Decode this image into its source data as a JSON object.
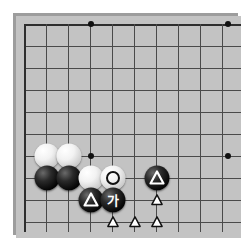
{
  "diagram": {
    "type": "go-board-diagram",
    "game": "Go (Baduk)",
    "board_region": "bottom-left corner, partial board",
    "grid": {
      "columns": 10,
      "rows": 10,
      "spacing_px": 22,
      "origin_x": 24,
      "origin_y": 24,
      "line_color": "#4a4a4a",
      "edge_color": "#2e2e2e",
      "board_color": "#c3c3c3",
      "shadow_color": "#9d9d9d"
    },
    "star_points": [
      {
        "name": "hoshi-upper-left",
        "x": 91,
        "y": 24
      },
      {
        "name": "hoshi-upper-right",
        "x": 228,
        "y": 24
      },
      {
        "name": "hoshi-lower-left",
        "x": 91,
        "y": 156
      },
      {
        "name": "hoshi-lower-right",
        "x": 228,
        "y": 156
      }
    ],
    "stones": [
      {
        "id": "w1",
        "color": "white",
        "x": 47,
        "y": 156,
        "mark": "none",
        "label": ""
      },
      {
        "id": "w2",
        "color": "white",
        "x": 69,
        "y": 156,
        "mark": "none",
        "label": ""
      },
      {
        "id": "b1",
        "color": "black",
        "x": 47,
        "y": 178,
        "mark": "none",
        "label": ""
      },
      {
        "id": "b2",
        "color": "black",
        "x": 69,
        "y": 178,
        "mark": "none",
        "label": ""
      },
      {
        "id": "w3",
        "color": "white",
        "x": 91,
        "y": 178,
        "mark": "none",
        "label": ""
      },
      {
        "id": "w4",
        "color": "white",
        "x": 113,
        "y": 178,
        "mark": "circle",
        "label": ""
      },
      {
        "id": "b3",
        "color": "black",
        "x": 157,
        "y": 178,
        "mark": "triangle",
        "label": ""
      },
      {
        "id": "b4",
        "color": "black",
        "x": 91,
        "y": 200,
        "mark": "triangle",
        "label": ""
      },
      {
        "id": "b5",
        "color": "black",
        "x": 113,
        "y": 200,
        "mark": "glyph",
        "label": "가"
      }
    ],
    "bare_marks": [
      {
        "id": "t1",
        "shape": "triangle",
        "x": 157,
        "y": 200
      },
      {
        "id": "t2",
        "shape": "triangle",
        "x": 113,
        "y": 222
      },
      {
        "id": "t3",
        "shape": "triangle",
        "x": 135,
        "y": 222
      },
      {
        "id": "t4",
        "shape": "triangle",
        "x": 157,
        "y": 222
      }
    ],
    "labels": {
      "korean_point_marker": "가",
      "marker_meaning_circle": "circle-marked white stone",
      "marker_meaning_triangle": "triangle-marked point"
    }
  }
}
